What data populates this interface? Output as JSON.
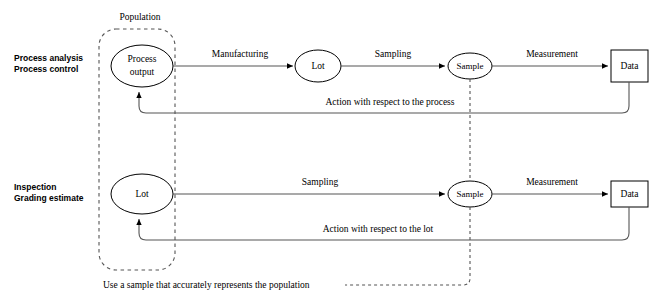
{
  "diagram": {
    "colors": {
      "line": "#555555",
      "shape_stroke": "#000000",
      "shape_fill": "#ffffff",
      "text": "#000000",
      "background": "#ffffff"
    },
    "group": {
      "label": "Population"
    },
    "rows": [
      {
        "id": "process",
        "row_label_line1": "Process analysis",
        "row_label_line2": "Process control",
        "nodes": {
          "source_line1": "Process",
          "source_line2": "output",
          "lot": "Lot",
          "sample": "Sample",
          "data": "Data"
        },
        "edges": {
          "first": "Manufacturing",
          "second": "Sampling",
          "third": "Measurement",
          "feedback": "Action with respect to the process"
        }
      },
      {
        "id": "inspection",
        "row_label_line1": "Inspection",
        "row_label_line2": "Grading estimate",
        "nodes": {
          "source": "Lot",
          "sample": "Sample",
          "data": "Data"
        },
        "edges": {
          "second": "Sampling",
          "third": "Measurement",
          "feedback": "Action with respect to the lot"
        }
      }
    ],
    "caption": "Use a sample that accurately represents the population"
  }
}
